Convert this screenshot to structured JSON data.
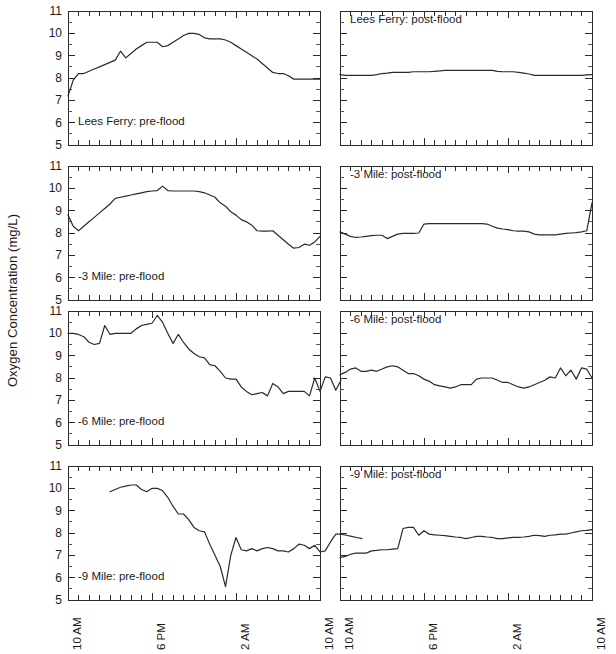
{
  "figure": {
    "ylabel": "Oxygen Concentration (mg/L)",
    "line_color": "#2b2b2b",
    "axis_color": "#2b2b2b",
    "background": "#ffffff"
  },
  "chart_data": {
    "type": "line",
    "title": "",
    "xlabel": "",
    "ylabel": "Oxygen Concentration (mg/L)",
    "ylim": [
      5,
      11
    ],
    "ytick_labels": [
      "11",
      "10",
      "9",
      "8",
      "7",
      "6",
      "5"
    ],
    "ytick_values": [
      11,
      10,
      9,
      8,
      7,
      6,
      5
    ],
    "xlim": [
      0,
      24
    ],
    "xtick_labels": [
      "10 AM",
      "6 PM",
      "2 AM",
      "10 AM"
    ],
    "xtick_values": [
      0,
      8,
      16,
      24
    ],
    "xtick_minor_interval": 1,
    "grid": false,
    "legend": "none",
    "layout": {
      "rows": 4,
      "cols": 2
    },
    "panels": [
      {
        "id": "lees-ferry-pre-flood",
        "label": "Lees Ferry: pre-flood",
        "row": 0,
        "col": 0,
        "x_start": 0,
        "x_step": 0.5,
        "values": [
          7.2,
          7.9,
          8.2,
          8.2,
          8.3,
          8.4,
          8.5,
          8.6,
          8.7,
          8.8,
          9.2,
          8.9,
          9.1,
          9.3,
          9.45,
          9.6,
          9.6,
          9.6,
          9.4,
          9.45,
          9.6,
          9.75,
          9.9,
          10.0,
          10.0,
          9.95,
          9.8,
          9.75,
          9.75,
          9.75,
          9.7,
          9.6,
          9.45,
          9.3,
          9.15,
          9.0,
          8.85,
          8.65,
          8.45,
          8.25,
          8.2,
          8.2,
          8.1,
          7.95,
          7.95,
          7.95,
          7.95,
          7.95,
          7.95
        ]
      },
      {
        "id": "lees-ferry-post-flood",
        "label": "Lees Ferry: post-flood",
        "row": 0,
        "col": 1,
        "x_start": 0,
        "x_step": 0.5,
        "values": [
          8.15,
          8.12,
          8.12,
          8.12,
          8.12,
          8.12,
          8.12,
          8.15,
          8.2,
          8.22,
          8.25,
          8.25,
          8.25,
          8.25,
          8.28,
          8.28,
          8.28,
          8.28,
          8.3,
          8.32,
          8.34,
          8.34,
          8.34,
          8.34,
          8.34,
          8.34,
          8.34,
          8.34,
          8.34,
          8.34,
          8.3,
          8.28,
          8.28,
          8.28,
          8.25,
          8.22,
          8.18,
          8.12,
          8.12,
          8.12,
          8.12,
          8.12,
          8.12,
          8.12,
          8.12,
          8.12,
          8.12,
          8.14,
          8.15
        ]
      },
      {
        "id": "minus-3-mile-pre-flood",
        "label": "-3 Mile: pre-flood",
        "row": 1,
        "col": 0,
        "x_start": 0,
        "x_step": 0.5,
        "values": [
          8.8,
          8.3,
          8.1,
          8.3,
          8.5,
          8.7,
          8.9,
          9.1,
          9.3,
          9.55,
          9.6,
          9.65,
          9.7,
          9.75,
          9.8,
          9.85,
          9.88,
          9.9,
          10.1,
          9.9,
          9.88,
          9.88,
          9.88,
          9.88,
          9.88,
          9.85,
          9.8,
          9.7,
          9.6,
          9.35,
          9.2,
          8.95,
          8.8,
          8.6,
          8.5,
          8.35,
          8.1,
          8.08,
          8.08,
          8.1,
          7.9,
          7.7,
          7.5,
          7.32,
          7.35,
          7.5,
          7.45,
          7.6,
          7.85
        ]
      },
      {
        "id": "minus-3-mile-post-flood",
        "label": "-3 Mile: post-flood",
        "row": 1,
        "col": 1,
        "x_start": 0,
        "x_step": 0.5,
        "values": [
          8.05,
          7.95,
          7.85,
          7.8,
          7.82,
          7.85,
          7.88,
          7.9,
          7.9,
          7.75,
          7.85,
          7.95,
          7.98,
          7.98,
          7.98,
          8.0,
          8.4,
          8.42,
          8.42,
          8.42,
          8.42,
          8.42,
          8.42,
          8.42,
          8.42,
          8.42,
          8.42,
          8.42,
          8.4,
          8.3,
          8.22,
          8.18,
          8.15,
          8.1,
          8.08,
          8.08,
          8.05,
          7.95,
          7.92,
          7.92,
          7.92,
          7.92,
          7.95,
          7.98,
          8.0,
          8.02,
          8.05,
          8.1,
          9.35
        ]
      },
      {
        "id": "minus-6-mile-pre-flood",
        "label": "-6 Mile: pre-flood",
        "row": 2,
        "col": 0,
        "x_start": 0,
        "x_step": 0.5,
        "values": [
          10.0,
          10.0,
          9.95,
          9.85,
          9.6,
          9.5,
          9.55,
          10.35,
          9.95,
          10.0,
          10.0,
          10.0,
          10.0,
          10.2,
          10.35,
          10.4,
          10.45,
          10.8,
          10.5,
          10.0,
          9.55,
          9.95,
          9.6,
          9.3,
          9.1,
          8.95,
          8.9,
          8.6,
          8.55,
          8.3,
          8.0,
          7.95,
          7.95,
          7.6,
          7.4,
          7.25,
          7.3,
          7.35,
          7.2,
          7.75,
          7.6,
          7.3,
          7.4,
          7.4,
          7.4,
          7.4,
          7.2,
          8.0,
          7.4,
          8.05,
          8.0,
          7.45,
          7.9
        ]
      },
      {
        "id": "minus-6-mile-post-flood",
        "label": "-6 Mile: post-flood",
        "row": 2,
        "col": 1,
        "x_start": 0,
        "x_step": 0.5,
        "values": [
          8.15,
          8.25,
          8.4,
          8.45,
          8.3,
          8.3,
          8.35,
          8.3,
          8.4,
          8.5,
          8.55,
          8.5,
          8.35,
          8.2,
          8.2,
          8.1,
          7.95,
          7.85,
          7.7,
          7.65,
          7.6,
          7.55,
          7.6,
          7.7,
          7.7,
          7.7,
          7.95,
          8.0,
          8.0,
          8.0,
          7.9,
          7.8,
          7.8,
          7.7,
          7.6,
          7.55,
          7.6,
          7.7,
          7.8,
          7.9,
          8.05,
          8.0,
          8.45,
          8.1,
          8.35,
          7.95,
          8.45,
          8.4,
          8.0
        ]
      },
      {
        "id": "minus-9-mile-pre-flood",
        "label": "-9 Mile: pre-flood",
        "row": 3,
        "col": 0,
        "x_start": 4,
        "x_step": 0.5,
        "values": [
          9.85,
          9.95,
          10.05,
          10.1,
          10.15,
          10.15,
          9.95,
          9.85,
          10.0,
          10.0,
          9.9,
          9.6,
          9.2,
          8.85,
          8.85,
          8.6,
          8.25,
          8.1,
          8.05,
          7.5,
          7.0,
          6.5,
          5.6,
          7.0,
          7.8,
          7.25,
          7.2,
          7.3,
          7.2,
          7.3,
          7.35,
          7.3,
          7.2,
          7.2,
          7.15,
          7.3,
          7.5,
          7.45,
          7.3,
          7.45,
          7.15,
          7.2,
          7.6,
          7.95,
          7.95,
          7.9,
          7.85,
          7.8,
          7.75
        ]
      },
      {
        "id": "minus-9-mile-post-flood",
        "label": "-9 Mile: post-flood",
        "row": 3,
        "col": 1,
        "x_start": 0,
        "x_step": 0.5,
        "values": [
          6.9,
          6.95,
          7.05,
          7.1,
          7.1,
          7.1,
          7.2,
          7.22,
          7.25,
          7.25,
          7.28,
          7.3,
          8.2,
          8.25,
          8.25,
          7.9,
          8.1,
          7.95,
          7.92,
          7.9,
          7.88,
          7.85,
          7.82,
          7.8,
          7.75,
          7.8,
          7.85,
          7.85,
          7.82,
          7.8,
          7.75,
          7.75,
          7.78,
          7.8,
          7.8,
          7.82,
          7.85,
          7.9,
          7.88,
          7.85,
          7.9,
          7.92,
          7.95,
          7.95,
          8.0,
          8.05,
          8.1,
          8.12,
          8.15
        ]
      }
    ]
  }
}
